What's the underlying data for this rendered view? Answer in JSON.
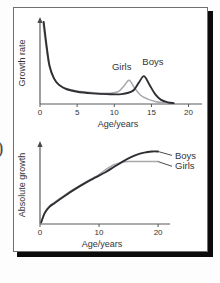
{
  "figure": {
    "edge_glyph": ")",
    "background_color": "#ffffff",
    "frame_color": "#6f6f6f",
    "shadow_color": "#0b0b0b"
  },
  "palette": {
    "boys_color": "#2f2f33",
    "girls_color": "#a9a9ad",
    "axis_color": "#58585a",
    "text_color": "#333336"
  },
  "chart_data": [
    {
      "id": "growth-rate",
      "type": "line",
      "title": "",
      "xlabel": "Age/years",
      "ylabel": "Growth rate",
      "xlim": [
        0,
        21
      ],
      "ylim": [
        0,
        100
      ],
      "grid": false,
      "xticks": [
        0,
        5,
        10,
        15,
        20
      ],
      "xticklabels": [
        "0",
        "5",
        "10",
        "15",
        "20"
      ],
      "yticks": [],
      "yticklabels": [],
      "legend_position": "inline-annotation",
      "annotations": [
        {
          "text": "Girls",
          "x": 11.0,
          "y": 42
        },
        {
          "text": "Boys",
          "x": 15.2,
          "y": 48
        }
      ],
      "series": [
        {
          "name": "Girls",
          "color": "#a9a9ad",
          "x": [
            0.4,
            0.8,
            1.2,
            1.8,
            2.5,
            3.5,
            5.0,
            7.0,
            9.0,
            10.5,
            11.3,
            12.0,
            12.7,
            13.5,
            14.5,
            15.5,
            16.5,
            17.5
          ],
          "values": [
            100,
            72,
            48,
            32,
            24,
            19,
            16,
            14,
            13,
            15,
            22,
            29,
            20,
            11,
            6,
            3,
            1.5,
            0.8
          ]
        },
        {
          "name": "Boys",
          "color": "#2f2f33",
          "x": [
            0.5,
            0.9,
            1.3,
            1.9,
            2.6,
            3.6,
            5.0,
            7.0,
            9.0,
            11.0,
            12.5,
            13.3,
            14.0,
            14.7,
            15.5,
            16.3,
            17.2,
            18.0
          ],
          "values": [
            100,
            70,
            46,
            31,
            23,
            18,
            15,
            13,
            12,
            12,
            16,
            26,
            34,
            24,
            12,
            5,
            2,
            1
          ]
        }
      ]
    },
    {
      "id": "absolute-growth",
      "type": "line",
      "title": "",
      "xlabel": "Age/years",
      "ylabel": "Absolute growth",
      "xlim": [
        0,
        21
      ],
      "ylim": [
        0,
        100
      ],
      "grid": false,
      "xticks": [
        0,
        10,
        20
      ],
      "xticklabels": [
        "0",
        "10",
        "20"
      ],
      "yticks": [],
      "yticklabels": [],
      "legend_position": "right-leader-lines",
      "annotations": [
        {
          "text": "Boys",
          "x": 20.5,
          "y": 88
        },
        {
          "text": "Girls",
          "x": 20.5,
          "y": 74
        }
      ],
      "series": [
        {
          "name": "Boys",
          "color": "#2f2f33",
          "x": [
            0.2,
            0.8,
            1.6,
            2.5,
            4.0,
            6.0,
            8.0,
            9.5,
            11.0,
            12.5,
            14.0,
            15.5,
            16.8,
            18.0,
            19.0,
            20.0
          ],
          "values": [
            2,
            14,
            22,
            27,
            35,
            45,
            54,
            60,
            66,
            73,
            80,
            86,
            90,
            92,
            93,
            93
          ]
        },
        {
          "name": "Girls",
          "color": "#a9a9ad",
          "x": [
            0.2,
            0.8,
            1.6,
            2.5,
            4.0,
            6.0,
            8.0,
            9.5,
            11.0,
            12.5,
            13.8,
            15.0,
            16.2,
            17.5,
            19.0,
            20.0
          ],
          "values": [
            2,
            15,
            23,
            28,
            36,
            46,
            55,
            61,
            69,
            76,
            79,
            80,
            80,
            80,
            80,
            80
          ]
        }
      ]
    }
  ]
}
